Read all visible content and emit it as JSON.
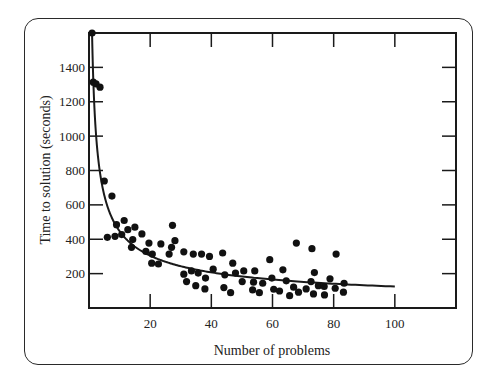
{
  "chart_data": {
    "type": "scatter",
    "title": "",
    "xlabel": "Number of problems",
    "ylabel": "Time to solution (seconds)",
    "xlim": [
      0,
      120
    ],
    "ylim": [
      0,
      1600
    ],
    "x_ticks": [
      20,
      40,
      60,
      80,
      100
    ],
    "x_tick_labels": [
      "20",
      "40",
      "60",
      "80",
      "100"
    ],
    "y_ticks": [
      200,
      400,
      600,
      800,
      1000,
      1200,
      1400
    ],
    "y_tick_labels": [
      "200",
      "400",
      "600",
      "800",
      "1000",
      "1200",
      "1400"
    ],
    "grid": false,
    "legend": null,
    "series": [
      {
        "name": "observations",
        "kind": "scatter",
        "points": [
          [
            1,
            1600
          ],
          [
            1.4,
            1314
          ],
          [
            2.3,
            1304
          ],
          [
            3.6,
            1285
          ],
          [
            5,
            739
          ],
          [
            7.5,
            651
          ],
          [
            6,
            411
          ],
          [
            8.5,
            417
          ],
          [
            9,
            485
          ],
          [
            11.5,
            509
          ],
          [
            10.7,
            427
          ],
          [
            12.7,
            456
          ],
          [
            15,
            470
          ],
          [
            14.3,
            398
          ],
          [
            13.9,
            353
          ],
          [
            17.3,
            431
          ],
          [
            18.6,
            329
          ],
          [
            19.6,
            378
          ],
          [
            23.5,
            373
          ],
          [
            27.3,
            481
          ],
          [
            28.1,
            392
          ],
          [
            27,
            353
          ],
          [
            26.2,
            314
          ],
          [
            20.7,
            314
          ],
          [
            20.5,
            261
          ],
          [
            22.7,
            256
          ],
          [
            31,
            327
          ],
          [
            34.1,
            314
          ],
          [
            36.8,
            314
          ],
          [
            39.4,
            300
          ],
          [
            43.7,
            320
          ],
          [
            47,
            261
          ],
          [
            31,
            197
          ],
          [
            33.5,
            216
          ],
          [
            35.7,
            203
          ],
          [
            38.1,
            174
          ],
          [
            40.6,
            226
          ],
          [
            44.4,
            193
          ],
          [
            47.9,
            203
          ],
          [
            50.6,
            216
          ],
          [
            54.2,
            216
          ],
          [
            31.9,
            154
          ],
          [
            34.9,
            130
          ],
          [
            37.9,
            111
          ],
          [
            44.1,
            119
          ],
          [
            46.3,
            89
          ],
          [
            50.1,
            154
          ],
          [
            53.8,
            150
          ],
          [
            56.8,
            144
          ],
          [
            53.5,
            105
          ],
          [
            55.7,
            89
          ],
          [
            59.1,
            281
          ],
          [
            59.8,
            174
          ],
          [
            60.4,
            109
          ],
          [
            63.4,
            222
          ],
          [
            62.3,
            99
          ],
          [
            64.5,
            158
          ],
          [
            65.6,
            72
          ],
          [
            66.9,
            121
          ],
          [
            67.8,
            378
          ],
          [
            68.5,
            92
          ],
          [
            71,
            111
          ],
          [
            72.9,
            345
          ],
          [
            73.4,
            82
          ],
          [
            73.7,
            206
          ],
          [
            72.6,
            154
          ],
          [
            75,
            130
          ],
          [
            76.9,
            125
          ],
          [
            77,
            76
          ],
          [
            78.8,
            170
          ],
          [
            80.5,
            115
          ],
          [
            80.8,
            314
          ],
          [
            83.4,
            144
          ],
          [
            83.2,
            92
          ]
        ]
      },
      {
        "name": "fitted power curve",
        "kind": "line",
        "formula": "y = 1600 * x^-0.554",
        "x_range": [
          1,
          100
        ]
      }
    ]
  }
}
